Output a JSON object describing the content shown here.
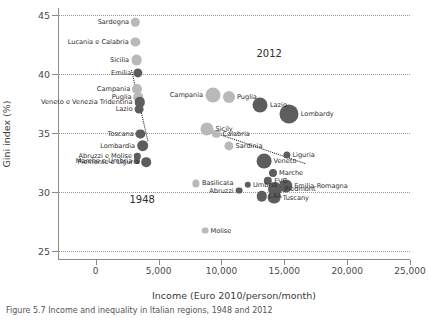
{
  "chart_data": {
    "type": "scatter",
    "title": "",
    "xlabel": "Income (Euro 2010/person/month)",
    "ylabel": "Gini index (%)",
    "xlim": [
      -3000,
      25000
    ],
    "ylim": [
      24.2,
      45.6
    ],
    "xticks": [
      0,
      5000,
      10000,
      15000,
      20000,
      25000
    ],
    "xticklabels": [
      "0",
      "5,000",
      "10,000",
      "15,000",
      "20,000",
      "25,000"
    ],
    "yticks": [
      25,
      30,
      35,
      40,
      45
    ],
    "yticklabels": [
      "25",
      "30",
      "35",
      "40",
      "45"
    ],
    "grid": "horizontal dotted",
    "legend": "none",
    "size_encoding": "bubble area ~ population",
    "annotations": [
      {
        "text": "1948",
        "x": 3700,
        "y": 29.4
      },
      {
        "text": "2012",
        "x": 13800,
        "y": 41.8
      }
    ],
    "series": [
      {
        "name": "1948",
        "color": "#b9b9b9",
        "trendline": {
          "x0": 2850,
          "y0": 40.3,
          "x1": 4150,
          "y1": 34.3
        },
        "points": [
          {
            "label": "Sardegna",
            "x": 3150,
            "y": 44.4,
            "r": 4.2,
            "shade": "light",
            "side": "r"
          },
          {
            "label": "Lucania e Calabria",
            "x": 3150,
            "y": 42.7,
            "r": 4.6,
            "shade": "light",
            "side": "r"
          },
          {
            "label": "Sicilia",
            "x": 3250,
            "y": 41.2,
            "r": 5.4,
            "shade": "light",
            "side": "r"
          },
          {
            "label": "Emilia",
            "x": 3350,
            "y": 40.1,
            "r": 4.6,
            "shade": "dark",
            "side": "r"
          },
          {
            "label": "Campania",
            "x": 3300,
            "y": 38.7,
            "r": 5.0,
            "shade": "light",
            "side": "r"
          },
          {
            "label": "Puglia",
            "x": 3400,
            "y": 38.0,
            "r": 4.8,
            "shade": "light",
            "side": "r"
          },
          {
            "label": "Veneto e Venezia Tridentina",
            "x": 3500,
            "y": 37.6,
            "r": 5.2,
            "shade": "dark",
            "side": "r"
          },
          {
            "label": "Lazio",
            "x": 3450,
            "y": 37.0,
            "r": 4.4,
            "shade": "dark",
            "side": "r"
          },
          {
            "label": "Toscana",
            "x": 3550,
            "y": 34.9,
            "r": 4.6,
            "shade": "dark",
            "side": "r"
          },
          {
            "label": "Lombardia",
            "x": 3750,
            "y": 33.9,
            "r": 5.8,
            "shade": "dark",
            "side": "r"
          },
          {
            "label": "Abruzzi e Molise",
            "x": 3300,
            "y": 33.0,
            "r": 3.2,
            "shade": "dark",
            "side": "r"
          },
          {
            "label": "Marche e Umbria",
            "x": 3300,
            "y": 32.6,
            "r": 3.0,
            "shade": "dark",
            "side": "r"
          },
          {
            "label": "Piemonte e Liguria",
            "x": 4000,
            "y": 32.5,
            "r": 4.8,
            "shade": "dark",
            "side": "r"
          }
        ]
      },
      {
        "name": "2012",
        "color": "#9e9e9e",
        "trendline": {
          "x0": 8700,
          "y0": 35.3,
          "x1": 16700,
          "y1": 32.4
        },
        "points": [
          {
            "label": "Campania",
            "x": 9300,
            "y": 38.2,
            "r": 7.5,
            "shade": "light",
            "side": "r"
          },
          {
            "label": "Puglia",
            "x": 10600,
            "y": 38.0,
            "r": 6.0,
            "shade": "light",
            "side": "l"
          },
          {
            "label": "Lazio",
            "x": 13100,
            "y": 37.4,
            "r": 7.5,
            "shade": "dark",
            "side": "l"
          },
          {
            "label": "Lombardy",
            "x": 15400,
            "y": 36.6,
            "r": 9.5,
            "shade": "dark",
            "side": "l"
          },
          {
            "label": "Sicily",
            "x": 8850,
            "y": 35.3,
            "r": 6.6,
            "shade": "light",
            "side": "l"
          },
          {
            "label": "Calabria",
            "x": 9600,
            "y": 34.9,
            "r": 4.2,
            "shade": "light",
            "side": "l"
          },
          {
            "label": "Sardinia",
            "x": 10600,
            "y": 33.9,
            "r": 4.6,
            "shade": "light",
            "side": "l"
          },
          {
            "label": "Liguria",
            "x": 15200,
            "y": 33.1,
            "r": 3.6,
            "shade": "dark",
            "side": "l"
          },
          {
            "label": "Veneto",
            "x": 13400,
            "y": 32.6,
            "r": 7.4,
            "shade": "dark",
            "side": "l"
          },
          {
            "label": "Marche",
            "x": 14100,
            "y": 31.6,
            "r": 4.0,
            "shade": "dark",
            "side": "l"
          },
          {
            "label": "Basilicata",
            "x": 8000,
            "y": 30.7,
            "r": 3.6,
            "shade": "light",
            "side": "l"
          },
          {
            "label": "Umbria",
            "x": 12100,
            "y": 30.6,
            "r": 3.2,
            "shade": "dark",
            "side": "l"
          },
          {
            "label": "FVG",
            "x": 13700,
            "y": 30.9,
            "r": 4.2,
            "shade": "dark",
            "side": "l"
          },
          {
            "label": "Emilia-Romagna",
            "x": 15100,
            "y": 30.5,
            "r": 6.6,
            "shade": "dark",
            "side": "l"
          },
          {
            "label": "Abruzzi",
            "x": 11400,
            "y": 30.1,
            "r": 3.4,
            "shade": "dark",
            "side": "r"
          },
          {
            "label": "Piedmont",
            "x": 14300,
            "y": 30.2,
            "r": 7.0,
            "shade": "dark",
            "side": "l"
          },
          {
            "label": "LAA",
            "x": 13200,
            "y": 29.6,
            "r": 5.2,
            "shade": "dark",
            "side": "l"
          },
          {
            "label": "Tuscany",
            "x": 14200,
            "y": 29.5,
            "r": 6.4,
            "shade": "dark",
            "side": "l"
          },
          {
            "label": "Molise",
            "x": 8700,
            "y": 26.7,
            "r": 3.4,
            "shade": "light",
            "side": "l"
          }
        ]
      }
    ]
  },
  "caption": {
    "text": "Figure 5.7  Income and inequality in Italian regions, 1948 and 2012"
  }
}
